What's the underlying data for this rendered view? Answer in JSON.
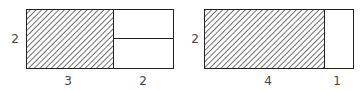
{
  "diagrams": [
    {
      "name": "area-model-3x2-plus-2x2",
      "side_label": "2",
      "bottom_labels": [
        "3",
        "2"
      ],
      "shaded_width": 3,
      "unshaded_width": 2,
      "unshaded_split_horizontal": true
    },
    {
      "name": "area-model-4x2-plus-1x2",
      "side_label": "2",
      "bottom_labels": [
        "4",
        "1"
      ],
      "shaded_width": 4,
      "unshaded_width": 1,
      "unshaded_split_horizontal": false
    }
  ],
  "colors": {
    "stroke": "#222222",
    "hatch": "#333333",
    "label": "#444444"
  }
}
